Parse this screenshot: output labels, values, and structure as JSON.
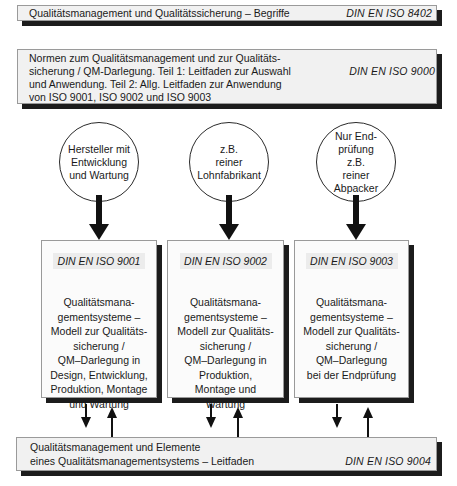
{
  "top_norm": {
    "title": "Qualitätsmanagement und Qualitätssicherung – Begriffe",
    "standard": "DIN EN ISO 8402"
  },
  "guide_norm": {
    "lines": [
      "Normen zum Qualitätsmanagement und zur Qualitäts-",
      "sicherung / QM-Darlegung. Teil 1: Leitfaden zur Auswahl",
      "und Anwendung. Teil 2: Allg. Leitfaden zur Anwendung",
      "von ISO 9001, ISO 9002 und ISO 9003"
    ],
    "standard": "DIN EN ISO 9000"
  },
  "columns": [
    {
      "circle_text": "Hersteller mit\nEntwicklung\nund Wartung",
      "standard": "DIN EN ISO 9001",
      "description": "Qualitätsmana-\ngementsysteme –\nModell zur Qualitäts-\nsicherung /\nQM–Darlegung in\nDesign, Entwicklung,\nProduktion, Montage\nund Wartung"
    },
    {
      "circle_text": "z.B.\nreiner\nLohnfabrikant",
      "standard": "DIN EN ISO 9002",
      "description": "Qualitätsmana-\ngementsysteme –\nModell zur Qualitäts-\nsicherung /\nQM–Darlegung in\nProduktion,\nMontage und\nWartung"
    },
    {
      "circle_text": "Nur End-\nprüfung\nz.B.\nreiner\nAbpacker",
      "standard": "DIN EN ISO 9003",
      "description": "Qualitätsmana-\ngementsysteme –\nModell zur Qualitäts-\nsicherung /\nQM–Darlegung\nbei der Endprüfung"
    }
  ],
  "bottom_norm": {
    "lines": [
      "Qualitätsmanagement und Elemente",
      "eines Qualitätsmanagementsystems – Leitfaden"
    ],
    "standard": "DIN EN ISO 9004"
  },
  "icons": {
    "down_arrow": "arrow-down-icon",
    "up_arrow": "arrow-up-icon"
  },
  "colors": {
    "box_fill": "#f1f1f1",
    "shadow": "#1c1c1c",
    "line": "#1a1a1a"
  }
}
